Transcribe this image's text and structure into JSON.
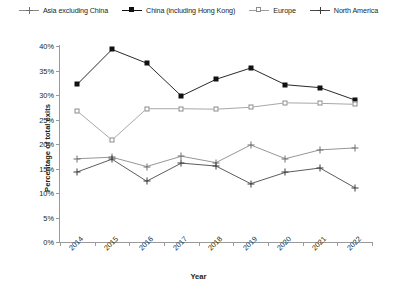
{
  "chart_data": {
    "type": "line",
    "title": "",
    "xlabel": "Year",
    "ylabel": "Percentage of total exits",
    "categories": [
      "2014",
      "2015",
      "2016",
      "2017",
      "2018",
      "2019",
      "2020",
      "2021",
      "2022"
    ],
    "ylim": [
      0,
      40
    ],
    "ytick_labels": [
      "0%",
      "5%",
      "10%",
      "15%",
      "20%",
      "25%",
      "30%",
      "35%",
      "40%"
    ],
    "ytick_values": [
      0,
      5,
      10,
      15,
      20,
      25,
      30,
      35,
      40
    ],
    "grid": false,
    "legend_position": "top",
    "series": [
      {
        "name": "Asia excluding China",
        "marker": "plus-icon",
        "color": "#8a8a8a",
        "values": [
          17.0,
          17.3,
          15.4,
          17.5,
          16.2,
          19.8,
          17.0,
          18.8,
          19.2
        ]
      },
      {
        "name": "China (including Hong Kong)",
        "marker": "filled-square-icon",
        "color": "#111111",
        "values": [
          32.2,
          39.3,
          36.5,
          29.8,
          33.2,
          35.5,
          32.1,
          31.5,
          29.0
        ]
      },
      {
        "name": "Europe",
        "marker": "open-square-icon",
        "color": "#9d9d9d",
        "values": [
          26.7,
          20.8,
          27.2,
          27.2,
          27.1,
          27.5,
          28.4,
          28.3,
          28.1
        ]
      },
      {
        "name": "North America",
        "marker": "plus-dark-icon",
        "color": "#4a4a4a",
        "values": [
          14.3,
          16.9,
          12.4,
          16.1,
          15.5,
          11.9,
          14.2,
          15.1,
          11.1
        ]
      }
    ]
  }
}
